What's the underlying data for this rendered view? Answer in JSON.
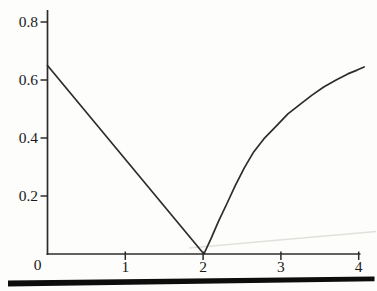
{
  "figure": {
    "background": "#fdfdfc"
  },
  "chart_data": {
    "type": "line",
    "title": "",
    "xlabel": "",
    "ylabel": "",
    "xlim": [
      0,
      4.1
    ],
    "ylim": [
      0,
      0.84
    ],
    "grid": false,
    "legend": null,
    "x_ticks": [
      1,
      2,
      3,
      4
    ],
    "x_tick_labels": [
      "1",
      "2",
      "3",
      "4"
    ],
    "y_ticks": [
      0.8,
      0.6,
      0.4,
      0.2
    ],
    "y_tick_labels": [
      "0.8",
      "0.6",
      "0.4",
      "0.2"
    ],
    "origin_label": "0",
    "series": [
      {
        "name": "descending-branch",
        "points": [
          [
            0,
            0.65
          ],
          [
            2.01,
            0
          ]
        ]
      },
      {
        "name": "ascending-branch",
        "points": [
          [
            2.01,
            0
          ],
          [
            2.1,
            0.052
          ],
          [
            2.2,
            0.114
          ],
          [
            2.31,
            0.176
          ],
          [
            2.41,
            0.234
          ],
          [
            2.53,
            0.297
          ],
          [
            2.65,
            0.352
          ],
          [
            2.78,
            0.397
          ],
          [
            2.94,
            0.441
          ],
          [
            3.09,
            0.483
          ],
          [
            3.25,
            0.517
          ],
          [
            3.4,
            0.548
          ],
          [
            3.55,
            0.576
          ],
          [
            3.71,
            0.6
          ],
          [
            3.86,
            0.621
          ],
          [
            3.98,
            0.634
          ],
          [
            4.07,
            0.645
          ]
        ]
      }
    ],
    "line_color": "#2e2c2a",
    "axis_color": "#2e2c2a",
    "label_color": "#1b1a18"
  },
  "decorations": {
    "bottom_rule_color": "#0d0d0d",
    "scan_artifact_color": "#dedcd6"
  }
}
